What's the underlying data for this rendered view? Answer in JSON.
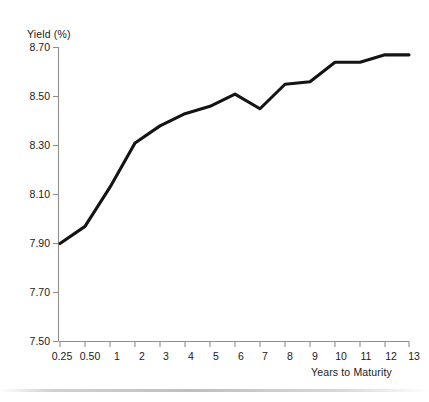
{
  "chart_data": {
    "type": "line",
    "title": "",
    "subtitle": "",
    "xlabel": "Years to Maturity",
    "ylabel": "Yield (%)",
    "x": [
      0.25,
      0.5,
      1,
      2,
      3,
      4,
      5,
      6,
      7,
      8,
      9,
      10,
      11,
      12,
      13
    ],
    "categories": [
      "0.25",
      "0.50",
      "1",
      "2",
      "3",
      "4",
      "5",
      "6",
      "7",
      "8",
      "9",
      "10",
      "11",
      "12",
      "13"
    ],
    "values": [
      7.9,
      7.97,
      8.13,
      8.31,
      8.38,
      8.43,
      8.46,
      8.51,
      8.45,
      8.55,
      8.56,
      8.64,
      8.64,
      8.67,
      8.67
    ],
    "series": [
      {
        "name": "Yield curve",
        "values": [
          7.9,
          7.97,
          8.13,
          8.31,
          8.38,
          8.43,
          8.46,
          8.51,
          8.45,
          8.55,
          8.56,
          8.64,
          8.64,
          8.67,
          8.67
        ]
      }
    ],
    "ylim": [
      7.5,
      8.7
    ],
    "yticks": [
      7.5,
      7.7,
      7.9,
      8.1,
      8.3,
      8.5,
      8.7
    ],
    "ytick_labels": [
      "7.50",
      "7.70",
      "7.90",
      "8.10",
      "8.30",
      "8.50",
      "8.70"
    ],
    "xtick_labels": [
      "0.25",
      "0.50",
      "1",
      "2",
      "3",
      "4",
      "5",
      "6",
      "7",
      "8",
      "9",
      "10",
      "11",
      "12",
      "13"
    ],
    "grid": false,
    "legend": "none",
    "line_color": "#111111",
    "axis_color": "#8a8a8a",
    "background_color": "#ffffff"
  },
  "axes": {
    "y_axis_title": "Yield (%)",
    "x_axis_title": "Years to Maturity"
  }
}
